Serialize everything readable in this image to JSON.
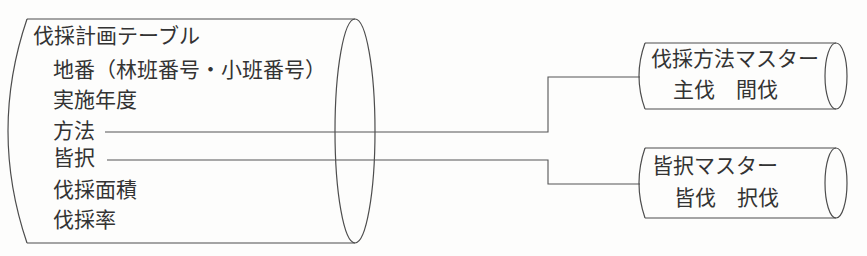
{
  "diagram": {
    "main_table": {
      "title": "伐採計画テーブル",
      "fields": [
        {
          "label": "地番（林班番号・小班番号）"
        },
        {
          "label": "実施年度"
        },
        {
          "label": "方法"
        },
        {
          "label": "皆択"
        },
        {
          "label": "伐採面積"
        },
        {
          "label": "伐採率"
        }
      ]
    },
    "masters": [
      {
        "title": "伐採方法マスター",
        "values": "主伐　間伐"
      },
      {
        "title": "皆択マスター",
        "values": "皆伐　択伐"
      }
    ],
    "links": [
      {
        "from_field": "方法",
        "to_master": "伐採方法マスター"
      },
      {
        "from_field": "皆択",
        "to_master": "皆択マスター"
      }
    ],
    "colors": {
      "background": "#fdfdfc",
      "stroke": "#4d4d4d",
      "text": "#333333"
    }
  }
}
